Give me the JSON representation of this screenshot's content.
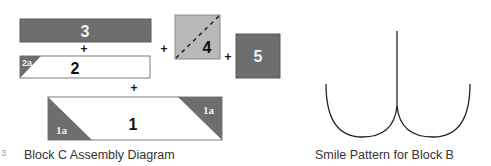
{
  "colors": {
    "dark_fill": "#6e6e6e",
    "light_fill": "#b9b9b9",
    "white_fill": "#ffffff",
    "outline": "#7a7a7a",
    "label_dark": "#111111",
    "label_light": "#f2f2f2",
    "curve": "#222222"
  },
  "assembly": {
    "caption": "Block C Assembly Diagram",
    "pieces": [
      {
        "id": "3",
        "label": "3",
        "fill": "dark"
      },
      {
        "id": "2",
        "label": "2",
        "fill": "white",
        "corner_label": "2a"
      },
      {
        "id": "4",
        "label": "4",
        "fill": "light",
        "dashed_diagonal": true
      },
      {
        "id": "5",
        "label": "5",
        "fill": "dark"
      },
      {
        "id": "1",
        "label": "1",
        "fill": "white",
        "corner_labels": [
          "1a",
          "1a"
        ]
      }
    ],
    "operators": [
      "+",
      "+",
      "+",
      "+"
    ],
    "margin_mark": "3"
  },
  "smile": {
    "caption": "Smile Pattern for Block B"
  }
}
